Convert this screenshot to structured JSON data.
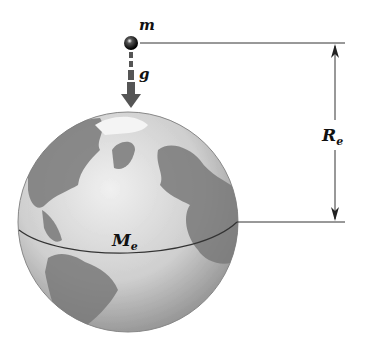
{
  "diagram": {
    "mass_label": "m",
    "gravity_label": "g",
    "radius_label": "R",
    "radius_subscript": "e",
    "earth_label": "M",
    "earth_subscript": "e",
    "colors": {
      "ocean": "#d9d9d9",
      "land": "#7a7a7a",
      "line": "#222222",
      "arrow": "#555555"
    }
  }
}
